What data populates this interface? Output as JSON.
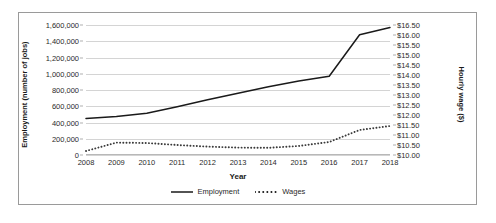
{
  "chart_data": {
    "type": "line",
    "title": "",
    "xlabel": "Year",
    "ylabel": "Employment (number of jobs)",
    "y2label": "Hourly wage ($)",
    "grid": true,
    "legend_position": "bottom",
    "categories": [
      2008,
      2009,
      2010,
      2011,
      2012,
      2013,
      2014,
      2015,
      2016,
      2017,
      2018
    ],
    "x_tick_labels": [
      "2008",
      "2009",
      "2010",
      "2011",
      "2012",
      "2013",
      "2014",
      "2015",
      "2016",
      "2017",
      "2018"
    ],
    "ylim": [
      0,
      1600000
    ],
    "y_ticks": [
      0,
      200000,
      400000,
      600000,
      800000,
      1000000,
      1200000,
      1400000,
      1600000
    ],
    "y_tick_labels": [
      "0",
      "200,000",
      "400,000",
      "600,000",
      "800,000",
      "1,000,000",
      "1,200,000",
      "1,400,000",
      "1,600,000"
    ],
    "y2lim": [
      10.0,
      16.5
    ],
    "y2_ticks": [
      10.0,
      10.5,
      11.0,
      11.5,
      12.0,
      12.5,
      13.0,
      13.5,
      14.0,
      14.5,
      15.0,
      15.5,
      16.0,
      16.5
    ],
    "y2_tick_labels": [
      "$10.00",
      "$10.50",
      "$11.00",
      "$11.50",
      "$12.00",
      "$12.50",
      "$13.00",
      "$13.50",
      "$14.00",
      "$14.50",
      "$15.00",
      "$15.50",
      "$16.00",
      "$16.50"
    ],
    "series": [
      {
        "name": "Employment",
        "axis": "left",
        "style": "solid",
        "color": "#1a1a1a",
        "values": [
          450000,
          475000,
          515000,
          595000,
          680000,
          760000,
          840000,
          910000,
          970000,
          1480000,
          1570000
        ]
      },
      {
        "name": "Wages",
        "axis": "right",
        "style": "dotted",
        "color": "#3a3a3a",
        "values": [
          10.2,
          10.62,
          10.6,
          10.5,
          10.42,
          10.37,
          10.36,
          10.45,
          10.65,
          11.25,
          11.45
        ]
      }
    ]
  },
  "legend": {
    "entries": [
      {
        "label": "Employment",
        "style": "solid"
      },
      {
        "label": "Wages",
        "style": "dotted"
      }
    ]
  }
}
